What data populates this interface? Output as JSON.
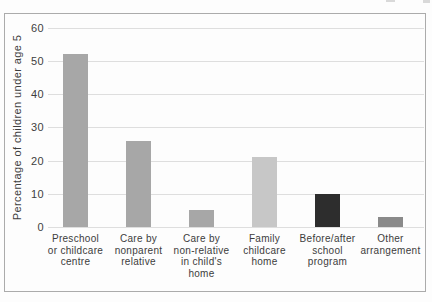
{
  "figure": {
    "background_color": "#fdfdfd",
    "border_color": "#ababab"
  },
  "chart_data": {
    "type": "bar",
    "title": "",
    "xlabel": "",
    "ylabel": "Percentage of children under age 5",
    "ylim": [
      0,
      60
    ],
    "yticks": [
      0,
      10,
      20,
      30,
      40,
      50,
      60
    ],
    "grid": "horizontal",
    "legend": "none",
    "categories": [
      "Preschool or childcare centre",
      "Care by nonparent relative",
      "Care by non-relative in child's home",
      "Family childcare home",
      "Before/after school program",
      "Other arrangement"
    ],
    "category_label_lines": [
      [
        "Preschool",
        "or childcare",
        "centre"
      ],
      [
        "Care by",
        "nonparent",
        "relative"
      ],
      [
        "Care by",
        "non-relative",
        "in child's",
        "home"
      ],
      [
        "Family",
        "childcare",
        "home"
      ],
      [
        "Before/after",
        "school",
        "program"
      ],
      [
        "Other",
        "arrangement"
      ]
    ],
    "values": [
      52,
      26,
      5,
      21,
      10,
      3
    ],
    "bar_colors": [
      "#a7a7a7",
      "#a7a7a7",
      "#a7a7a7",
      "#c7c7c7",
      "#2d2d2d",
      "#8a8a8a"
    ],
    "gridline_color": "#dedede",
    "tick_label_color": "#3e3e3e",
    "category_label_color": "#3c3c3c"
  }
}
